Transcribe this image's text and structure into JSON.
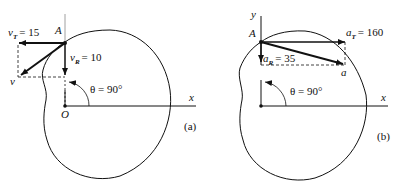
{
  "figure_a": {
    "panel_label": "(a)",
    "point_label": "A",
    "origin_label": "O",
    "x_axis_label": "x",
    "vT": {
      "symbol": "v",
      "subscript": "T",
      "value_text": "= 15"
    },
    "vR": {
      "symbol": "v",
      "subscript": "R",
      "value_text": "= 10"
    },
    "v_label": "v",
    "theta_label": "θ = 90°"
  },
  "figure_b": {
    "panel_label": "(b)",
    "point_label": "A",
    "y_axis_label": "y",
    "x_axis_label": "x",
    "aT": {
      "symbol": "a",
      "subscript": "T",
      "value_text": "= 160"
    },
    "aR": {
      "symbol": "a",
      "subscript": "R",
      "value_text": "= 35"
    },
    "a_label": "a",
    "theta_label": "θ = 90°"
  },
  "colors": {
    "ink": "#111111",
    "background": "#ffffff"
  }
}
